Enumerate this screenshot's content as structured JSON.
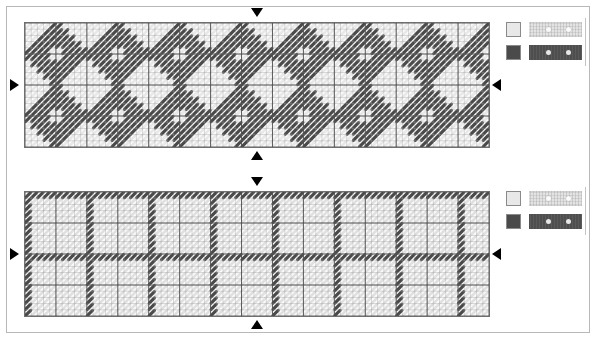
{
  "document": {
    "title": "Needlework Stitch Chart",
    "background_color": "#ffffff",
    "frame_color": "#b8b8b8"
  },
  "palette": {
    "light_thread": "#e8e8e8",
    "dark_thread": "#4a4a4a",
    "grid_line": "#9a9a9a",
    "grid_major_line": "#4d4d4d",
    "chart_background": "#fbfbfb",
    "marker_color": "#000000"
  },
  "panels": [
    {
      "id": "panel-top",
      "name": "top-stitch-chart",
      "chart": {
        "type": "stitch-grid",
        "columns": 75,
        "rows": 20,
        "cell_px": 6.2,
        "major_every": 5,
        "motif": "diagonal-chevron-diamond",
        "repeat_columns": 10,
        "repeat_rows": 10,
        "stitch_angle": "diagonal",
        "fill_stitch_color": "#4a4a4a",
        "ground_stitch_color": "#e8e8e8"
      },
      "markers": [
        {
          "name": "center-marker-top",
          "direction": "down",
          "axis": "horizontal"
        },
        {
          "name": "center-marker-bottom",
          "direction": "up",
          "axis": "horizontal"
        },
        {
          "name": "center-marker-left",
          "direction": "right",
          "axis": "vertical"
        },
        {
          "name": "center-marker-right",
          "direction": "left",
          "axis": "vertical"
        }
      ],
      "legend": {
        "name": "thread-legend-top",
        "entries": [
          {
            "swatch_color": "#e8e8e8",
            "sample_style": "light",
            "sample_dots": 2,
            "symbol": "light-thread-swatch"
          },
          {
            "swatch_color": "#4a4a4a",
            "sample_style": "dark",
            "sample_dots": 2,
            "symbol": "dark-thread-swatch"
          }
        ]
      }
    },
    {
      "id": "panel-bottom",
      "name": "bottom-stitch-chart",
      "chart": {
        "type": "stitch-grid",
        "columns": 75,
        "rows": 20,
        "cell_px": 6.2,
        "major_every": 5,
        "motif": "lattice-outline-blocks",
        "repeat_columns": 10,
        "repeat_rows": 10,
        "stitch_angle": "diagonal",
        "fill_stitch_color": "#4a4a4a",
        "ground_stitch_color": "#e0e0e0"
      },
      "markers": [
        {
          "name": "center-marker-top",
          "direction": "down",
          "axis": "horizontal"
        },
        {
          "name": "center-marker-bottom",
          "direction": "up",
          "axis": "horizontal"
        },
        {
          "name": "center-marker-left",
          "direction": "right",
          "axis": "vertical"
        },
        {
          "name": "center-marker-right",
          "direction": "left",
          "axis": "vertical"
        }
      ],
      "legend": {
        "name": "thread-legend-bottom",
        "entries": [
          {
            "swatch_color": "#e8e8e8",
            "sample_style": "light",
            "sample_dots": 2,
            "symbol": "light-thread-swatch"
          },
          {
            "swatch_color": "#4a4a4a",
            "sample_style": "dark",
            "sample_dots": 2,
            "symbol": "dark-thread-swatch"
          }
        ]
      }
    }
  ]
}
